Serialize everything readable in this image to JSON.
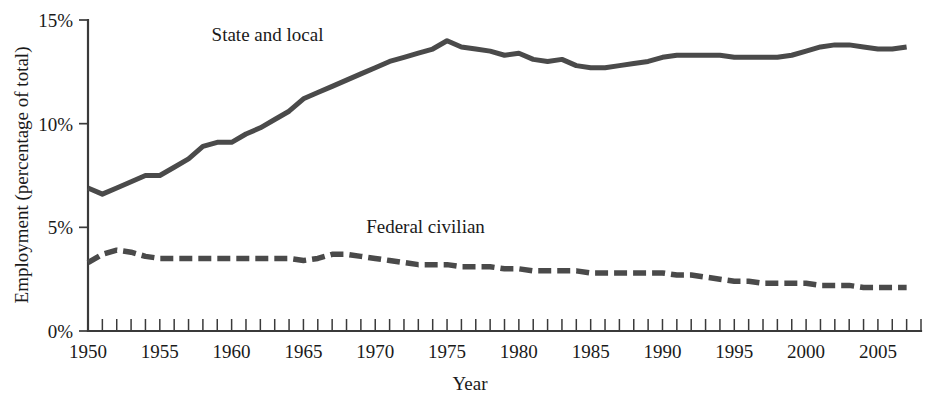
{
  "chart_data": {
    "type": "line",
    "title": "",
    "xlabel": "Year",
    "ylabel": "Employment (percentage of total)",
    "xlim": [
      1950,
      2008
    ],
    "ylim": [
      0,
      15
    ],
    "grid": false,
    "legend_position": "inline-annotation",
    "y_tick_labels": [
      "0%",
      "5%",
      "10%",
      "15%"
    ],
    "y_tick_values": [
      0,
      5,
      10,
      15
    ],
    "x_tick_labels": [
      "1950",
      "1955",
      "1960",
      "1965",
      "1970",
      "1975",
      "1980",
      "1985",
      "1990",
      "1995",
      "2000",
      "2005"
    ],
    "x_tick_values": [
      1950,
      1955,
      1960,
      1965,
      1970,
      1975,
      1980,
      1985,
      1990,
      1995,
      2000,
      2005
    ],
    "x_minor_tick_interval": 1,
    "x": [
      1950,
      1951,
      1952,
      1953,
      1954,
      1955,
      1956,
      1957,
      1958,
      1959,
      1960,
      1961,
      1962,
      1963,
      1964,
      1965,
      1966,
      1967,
      1968,
      1969,
      1970,
      1971,
      1972,
      1973,
      1974,
      1975,
      1976,
      1977,
      1978,
      1979,
      1980,
      1981,
      1982,
      1983,
      1984,
      1985,
      1986,
      1987,
      1988,
      1989,
      1990,
      1991,
      1992,
      1993,
      1994,
      1995,
      1996,
      1997,
      1998,
      1999,
      2000,
      2001,
      2002,
      2003,
      2004,
      2005,
      2006,
      2007
    ],
    "series": [
      {
        "name": "State and local",
        "style": "solid",
        "color": "#4a4a4a",
        "label_x": 1962.5,
        "label_y": 14.3,
        "values": [
          6.9,
          6.6,
          6.9,
          7.2,
          7.5,
          7.5,
          7.9,
          8.3,
          8.9,
          9.1,
          9.1,
          9.5,
          9.8,
          10.2,
          10.6,
          11.2,
          11.5,
          11.8,
          12.1,
          12.4,
          12.7,
          13.0,
          13.2,
          13.4,
          13.6,
          14.0,
          13.7,
          13.6,
          13.5,
          13.3,
          13.4,
          13.1,
          13.0,
          13.1,
          12.8,
          12.7,
          12.7,
          12.8,
          12.9,
          13.0,
          13.2,
          13.3,
          13.3,
          13.3,
          13.3,
          13.2,
          13.2,
          13.2,
          13.2,
          13.3,
          13.5,
          13.7,
          13.8,
          13.8,
          13.7,
          13.6,
          13.6,
          13.7
        ]
      },
      {
        "name": "Federal civilian",
        "style": "dashed",
        "color": "#4a4a4a",
        "label_x": 1973.5,
        "label_y": 5.0,
        "values": [
          3.3,
          3.7,
          3.9,
          3.8,
          3.6,
          3.5,
          3.5,
          3.5,
          3.5,
          3.5,
          3.5,
          3.5,
          3.5,
          3.5,
          3.5,
          3.4,
          3.5,
          3.7,
          3.7,
          3.6,
          3.5,
          3.4,
          3.3,
          3.2,
          3.2,
          3.2,
          3.1,
          3.1,
          3.1,
          3.0,
          3.0,
          2.9,
          2.9,
          2.9,
          2.9,
          2.8,
          2.8,
          2.8,
          2.8,
          2.8,
          2.8,
          2.7,
          2.7,
          2.6,
          2.5,
          2.4,
          2.4,
          2.3,
          2.3,
          2.3,
          2.3,
          2.2,
          2.2,
          2.2,
          2.1,
          2.1,
          2.1,
          2.1
        ]
      }
    ]
  }
}
